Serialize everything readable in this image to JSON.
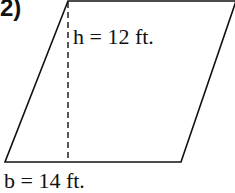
{
  "problem": {
    "number": "2)",
    "shape": "parallelogram",
    "height_label": "h = 12 ft.",
    "base_label": "b = 14 ft."
  },
  "colors": {
    "stroke": "#111111",
    "background": "#ffffff"
  }
}
